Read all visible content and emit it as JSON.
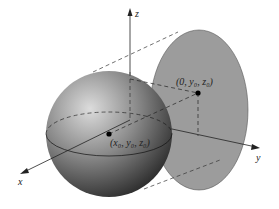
{
  "diagram": {
    "type": "3d-sphere-projection",
    "axes": {
      "x": "x",
      "y": "y",
      "z": "z"
    },
    "points": {
      "center": "(x₀, y₀, z₀)",
      "projection": "(0, y₀, z₀)"
    },
    "colors": {
      "sphere_light": "#d8d8d8",
      "sphere_dark": "#3a3a3a",
      "disk_fill": "#9a9a9a",
      "line": "#222222"
    }
  }
}
